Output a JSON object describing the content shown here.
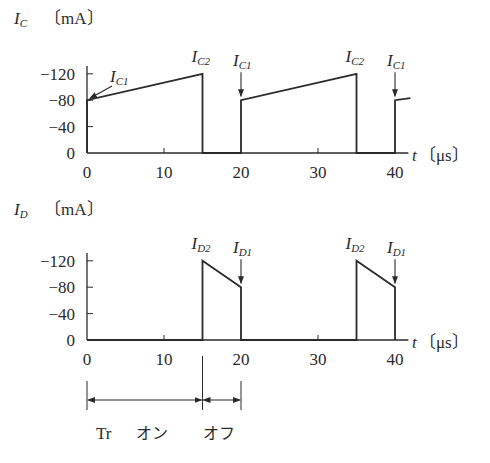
{
  "chart_data": [
    {
      "type": "line",
      "title": "",
      "ylabel": "I_C [mA]",
      "ylabel_symbol": "I",
      "ylabel_sub": "C",
      "ylabel_unit": "〔mA〕",
      "xlabel": "t [μs]",
      "xlabel_symbol": "t",
      "xlabel_unit": "〔μs〕",
      "yticks": [
        "0",
        "−40",
        "−80",
        "−120"
      ],
      "ytick_values": [
        0,
        40,
        80,
        120
      ],
      "xticks": [
        "0",
        "10",
        "20",
        "30",
        "40"
      ],
      "xtick_values": [
        0,
        10,
        20,
        30,
        40
      ],
      "xlim": [
        0,
        42
      ],
      "ylim": [
        0,
        135
      ],
      "grid": false,
      "series": [
        {
          "name": "I_C",
          "x": [
            0,
            0,
            15,
            15,
            20,
            20,
            35,
            35,
            40,
            40,
            42
          ],
          "y": [
            0,
            80,
            120,
            0,
            0,
            80,
            120,
            0,
            0,
            80,
            83
          ]
        }
      ],
      "annotations": [
        {
          "label": "I_C1",
          "sub": "C1",
          "x": 0,
          "y": 80
        },
        {
          "label": "I_C2",
          "sub": "C2",
          "x": 15,
          "y": 120
        },
        {
          "label": "I_C1",
          "sub": "C1",
          "x": 20,
          "y": 80
        },
        {
          "label": "I_C2",
          "sub": "C2",
          "x": 35,
          "y": 120
        },
        {
          "label": "I_C1",
          "sub": "C1",
          "x": 40,
          "y": 80
        }
      ]
    },
    {
      "type": "line",
      "title": "",
      "ylabel": "I_D [mA]",
      "ylabel_symbol": "I",
      "ylabel_sub": "D",
      "ylabel_unit": "〔mA〕",
      "xlabel": "t [μs]",
      "xlabel_symbol": "t",
      "xlabel_unit": "〔μs〕",
      "yticks": [
        "0",
        "−40",
        "−80",
        "−120"
      ],
      "ytick_values": [
        0,
        40,
        80,
        120
      ],
      "xticks": [
        "0",
        "10",
        "20",
        "30",
        "40"
      ],
      "xtick_values": [
        0,
        10,
        20,
        30,
        40
      ],
      "xlim": [
        0,
        42
      ],
      "ylim": [
        0,
        135
      ],
      "grid": false,
      "series": [
        {
          "name": "I_D",
          "x": [
            0,
            15,
            15,
            20,
            20,
            35,
            35,
            40,
            40
          ],
          "y": [
            0,
            0,
            120,
            80,
            0,
            0,
            120,
            80,
            0
          ]
        }
      ],
      "annotations": [
        {
          "label": "I_D2",
          "sub": "D2",
          "x": 15,
          "y": 120
        },
        {
          "label": "I_D1",
          "sub": "D1",
          "x": 20,
          "y": 80
        },
        {
          "label": "I_D2",
          "sub": "D2",
          "x": 35,
          "y": 120
        },
        {
          "label": "I_D1",
          "sub": "D1",
          "x": 40,
          "y": 80
        }
      ]
    }
  ],
  "timing": {
    "on_label_tr": "Tr",
    "on_label": "オン",
    "off_label": "オフ",
    "on_interval": [
      0,
      15
    ],
    "off_interval": [
      15,
      20
    ]
  }
}
